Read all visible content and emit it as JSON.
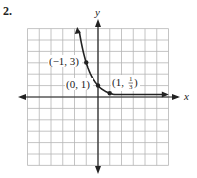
{
  "problem_number": "2.",
  "chart_data": {
    "type": "line",
    "title": "",
    "function": "y = (1/3)^x",
    "xlabel": "x",
    "ylabel": "y",
    "xlim": [
      -6,
      6
    ],
    "ylim": [
      -6,
      6
    ],
    "grid": true,
    "points": [
      {
        "x": -1,
        "y": 3,
        "label": "(−1, 3)"
      },
      {
        "x": 0,
        "y": 1,
        "label": "(0, 1)"
      },
      {
        "x": 1,
        "y": 0.3333,
        "label": "(1, 1/3)"
      }
    ],
    "annotations": [
      "(−1, 3)",
      "(0, 1)",
      "(1, 1/3)"
    ]
  },
  "labels": {
    "x_axis": "x",
    "y_axis": "y",
    "p1": "(−1, 3)",
    "p2": "(0, 1)",
    "p3_prefix": "(1, ",
    "p3_num": "1",
    "p3_den": "3",
    "p3_suffix": ")"
  }
}
